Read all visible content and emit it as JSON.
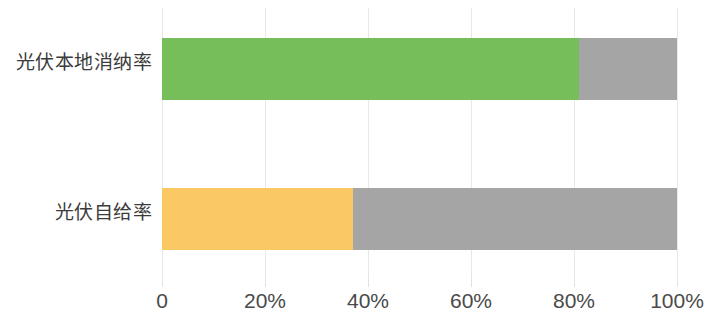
{
  "chart_data": {
    "type": "bar",
    "orientation": "horizontal",
    "stacked": true,
    "title": "",
    "subtitle": "",
    "xlabel": "",
    "ylabel": "",
    "categories": [
      "光伏本地消纳率",
      "光伏自给率"
    ],
    "series": [
      {
        "name": "值",
        "values": [
          81,
          37
        ],
        "colors": [
          "#76be5a",
          "#fbc963"
        ]
      },
      {
        "name": "剩余",
        "values": [
          19,
          63
        ],
        "color": "#a5a5a5"
      }
    ],
    "xlim": [
      0,
      100
    ],
    "x_tick_values": [
      0,
      20,
      40,
      60,
      80,
      100
    ],
    "x_tick_labels": [
      "0",
      "20%",
      "40%",
      "60%",
      "80%",
      "100%"
    ],
    "grid": true,
    "grid_axis": "x",
    "legend": false,
    "legend_position": "none",
    "annotations": []
  },
  "colors": {
    "green": "#76be5a",
    "amber": "#fbc963",
    "gray": "#a5a5a5",
    "gridline": "#e8e8e8",
    "label_text": "#3b3b3b",
    "tick_text": "#4a4a4a",
    "background": "#ffffff"
  }
}
